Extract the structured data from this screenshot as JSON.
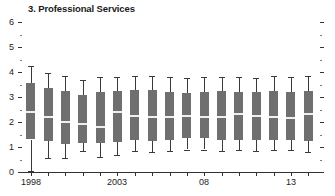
{
  "chart_data": {
    "type": "box",
    "title": "3. Professional Services",
    "xlabel": "",
    "ylabel": "",
    "ylim": [
      0,
      6
    ],
    "y_major_ticks": [
      0,
      1,
      2,
      3,
      4,
      5,
      6
    ],
    "y_major_tick_labels": [
      "0",
      "1",
      "2",
      "3",
      "4",
      "5",
      "6"
    ],
    "y_minor_ticks": [
      0.5,
      1.5,
      2.5,
      3.5,
      4.5,
      5.5
    ],
    "grid": false,
    "legend": "none",
    "right_axis_ticks": true,
    "x_tick_years": [
      1998,
      2003,
      2008,
      2013
    ],
    "x_tick_labels": [
      "1998",
      "2003",
      "08",
      "13"
    ],
    "categories": [
      1998,
      1999,
      2000,
      2001,
      2002,
      2003,
      2004,
      2005,
      2006,
      2007,
      2008,
      2009,
      2010,
      2011,
      2012,
      2013,
      2014
    ],
    "boxes": [
      {
        "year": 1998,
        "whisker_low": 0.05,
        "q1": 1.3,
        "median": 2.45,
        "q3": 3.55,
        "whisker_high": 4.25
      },
      {
        "year": 1999,
        "whisker_low": 0.55,
        "q1": 1.25,
        "median": 2.25,
        "q3": 3.35,
        "whisker_high": 3.95
      },
      {
        "year": 2000,
        "whisker_low": 0.55,
        "q1": 1.15,
        "median": 2.05,
        "q3": 3.25,
        "whisker_high": 3.85
      },
      {
        "year": 2001,
        "whisker_low": 0.85,
        "q1": 1.2,
        "median": 1.95,
        "q3": 3.1,
        "whisker_high": 3.7
      },
      {
        "year": 2002,
        "whisker_low": 0.6,
        "q1": 1.15,
        "median": 1.85,
        "q3": 3.2,
        "whisker_high": 3.8
      },
      {
        "year": 2003,
        "whisker_low": 0.7,
        "q1": 1.2,
        "median": 2.45,
        "q3": 3.25,
        "whisker_high": 3.8
      },
      {
        "year": 2004,
        "whisker_low": 0.85,
        "q1": 1.3,
        "median": 2.3,
        "q3": 3.3,
        "whisker_high": 3.85
      },
      {
        "year": 2005,
        "whisker_low": 0.8,
        "q1": 1.25,
        "median": 2.25,
        "q3": 3.3,
        "whisker_high": 3.85
      },
      {
        "year": 2006,
        "whisker_low": 0.85,
        "q1": 1.3,
        "median": 2.25,
        "q3": 3.2,
        "whisker_high": 3.8
      },
      {
        "year": 2007,
        "whisker_low": 0.9,
        "q1": 1.35,
        "median": 2.3,
        "q3": 3.15,
        "whisker_high": 3.75
      },
      {
        "year": 2008,
        "whisker_low": 0.9,
        "q1": 1.35,
        "median": 2.25,
        "q3": 3.2,
        "whisker_high": 3.8
      },
      {
        "year": 2009,
        "whisker_low": 0.85,
        "q1": 1.3,
        "median": 2.25,
        "q3": 3.25,
        "whisker_high": 3.8
      },
      {
        "year": 2010,
        "whisker_low": 0.9,
        "q1": 1.3,
        "median": 2.35,
        "q3": 3.2,
        "whisker_high": 3.8
      },
      {
        "year": 2011,
        "whisker_low": 0.85,
        "q1": 1.3,
        "median": 2.3,
        "q3": 3.2,
        "whisker_high": 3.75
      },
      {
        "year": 2012,
        "whisker_low": 0.9,
        "q1": 1.3,
        "median": 2.25,
        "q3": 3.25,
        "whisker_high": 3.85
      },
      {
        "year": 2013,
        "whisker_low": 0.9,
        "q1": 1.3,
        "median": 2.2,
        "q3": 3.2,
        "whisker_high": 3.8
      },
      {
        "year": 2014,
        "whisker_low": 0.8,
        "q1": 1.25,
        "median": 2.35,
        "q3": 3.25,
        "whisker_high": 3.85
      }
    ],
    "colors": {
      "box_fill": "#6f6f6f",
      "median": "#efefef",
      "whisker": "#3a3a3a",
      "axis": "#333333",
      "text": "#222222",
      "background": "#ffffff"
    }
  }
}
